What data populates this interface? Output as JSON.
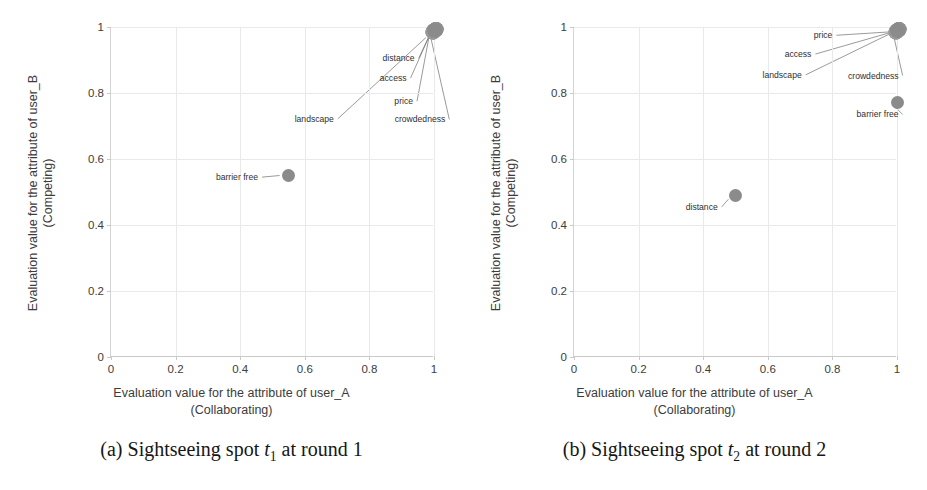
{
  "chart_data": [
    {
      "type": "scatter",
      "title": "",
      "caption_prefix": "(a) Sightseeing spot",
      "caption_symbol": "t",
      "caption_subscript": "1",
      "caption_suffix": "at round 1",
      "xlabel_line1": "Evaluation value for the attribute of user_A",
      "xlabel_line2": "(Collaborating)",
      "ylabel_line1": "Evaluation value for the attribute of user_B",
      "ylabel_line2": "(Competing)",
      "xlim": [
        0,
        1
      ],
      "ylim": [
        0,
        1
      ],
      "xticks": [
        "0",
        "0.2",
        "0.4",
        "0.6",
        "0.8",
        "1"
      ],
      "yticks": [
        "0",
        "0.2",
        "0.4",
        "0.6",
        "0.8",
        "1"
      ],
      "grid": true,
      "marker_color": "#8b8b8b",
      "points": [
        {
          "label": "distance",
          "x": 1.0,
          "y": 0.99,
          "stacked": true
        },
        {
          "label": "access",
          "x": 1.0,
          "y": 0.99,
          "stacked": true
        },
        {
          "label": "price",
          "x": 1.0,
          "y": 0.99,
          "stacked": true
        },
        {
          "label": "crowdedness",
          "x": 1.0,
          "y": 0.99,
          "stacked": true
        },
        {
          "label": "landscape",
          "x": 1.0,
          "y": 0.99,
          "stacked": true
        },
        {
          "label": "barrier free",
          "x": 0.55,
          "y": 0.55,
          "stacked": false
        }
      ],
      "annotations": [
        {
          "label": "distance",
          "lx": 0.94,
          "ly": 0.905,
          "align": "right",
          "tx": 0.985,
          "ty": 0.972
        },
        {
          "label": "access",
          "lx": 0.915,
          "ly": 0.845,
          "align": "right",
          "tx": 0.985,
          "ty": 0.972
        },
        {
          "label": "price",
          "lx": 0.935,
          "ly": 0.775,
          "align": "right",
          "tx": 0.985,
          "ty": 0.972
        },
        {
          "label": "crowdedness",
          "lx": 1.035,
          "ly": 0.72,
          "align": "right",
          "tx": 0.99,
          "ty": 0.968
        },
        {
          "label": "landscape",
          "lx": 0.69,
          "ly": 0.722,
          "align": "right",
          "tx": 0.975,
          "ty": 0.968
        },
        {
          "label": "barrier free",
          "lx": 0.455,
          "ly": 0.545,
          "align": "right",
          "tx": 0.522,
          "ty": 0.55
        }
      ]
    },
    {
      "type": "scatter",
      "title": "",
      "caption_prefix": "(b) Sightseeing spot",
      "caption_symbol": "t",
      "caption_subscript": "2",
      "caption_suffix": "at round 2",
      "xlabel_line1": "Evaluation value for the attribute of user_A",
      "xlabel_line2": "(Collaborating)",
      "ylabel_line1": "Evaluation value for the attribute of user_B",
      "ylabel_line2": "(Competing)",
      "xlim": [
        0,
        1
      ],
      "ylim": [
        0,
        1
      ],
      "xticks": [
        "0",
        "0.2",
        "0.4",
        "0.6",
        "0.8",
        "1"
      ],
      "yticks": [
        "0",
        "0.2",
        "0.4",
        "0.6",
        "0.8",
        "1"
      ],
      "grid": true,
      "marker_color": "#8b8b8b",
      "points": [
        {
          "label": "price",
          "x": 1.0,
          "y": 0.99,
          "stacked": true
        },
        {
          "label": "access",
          "x": 1.0,
          "y": 0.99,
          "stacked": true
        },
        {
          "label": "landscape",
          "x": 1.0,
          "y": 0.99,
          "stacked": true
        },
        {
          "label": "crowdedness",
          "x": 1.0,
          "y": 0.99,
          "stacked": true
        },
        {
          "label": "barrier free",
          "x": 1.0,
          "y": 0.77,
          "stacked": false
        },
        {
          "label": "distance",
          "x": 0.5,
          "y": 0.49,
          "stacked": false
        }
      ],
      "annotations": [
        {
          "label": "price",
          "lx": 0.8,
          "ly": 0.975,
          "align": "right",
          "tx": 0.975,
          "ty": 0.985
        },
        {
          "label": "access",
          "lx": 0.735,
          "ly": 0.918,
          "align": "right",
          "tx": 0.975,
          "ty": 0.982
        },
        {
          "label": "landscape",
          "lx": 0.705,
          "ly": 0.855,
          "align": "right",
          "tx": 0.975,
          "ty": 0.978
        },
        {
          "label": "crowdedness",
          "lx": 1.005,
          "ly": 0.853,
          "align": "right",
          "tx": 0.99,
          "ty": 0.972
        },
        {
          "label": "barrier free",
          "lx": 1.005,
          "ly": 0.735,
          "align": "right",
          "tx": 0.99,
          "ty": 0.762
        },
        {
          "label": "distance",
          "lx": 0.445,
          "ly": 0.455,
          "align": "right",
          "tx": 0.478,
          "ty": 0.478
        }
      ]
    }
  ]
}
